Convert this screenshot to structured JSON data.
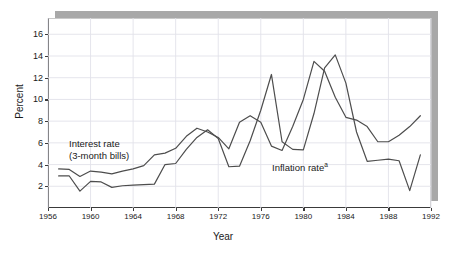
{
  "chart_data": {
    "type": "line",
    "title": "",
    "xlabel": "Year",
    "ylabel": "Percent",
    "xlim": [
      1956,
      1992
    ],
    "ylim": [
      0,
      17.5
    ],
    "grid": true,
    "legend_position": "inline-annotations",
    "xticks": [
      1956,
      1960,
      1964,
      1968,
      1972,
      1976,
      1980,
      1984,
      1988,
      1992
    ],
    "yticks": [
      2,
      4,
      6,
      8,
      10,
      12,
      14,
      16
    ],
    "x": [
      1957,
      1958,
      1959,
      1960,
      1961,
      1962,
      1963,
      1964,
      1965,
      1966,
      1967,
      1968,
      1969,
      1970,
      1971,
      1972,
      1973,
      1974,
      1975,
      1976,
      1977,
      1978,
      1979,
      1980,
      1981,
      1982,
      1983,
      1984,
      1985,
      1986,
      1987,
      1988,
      1989,
      1990,
      1991
    ],
    "series": [
      {
        "name": "Interest rate (3-month bills)",
        "values": [
          3.6,
          3.55,
          2.9,
          3.4,
          3.3,
          3.15,
          3.4,
          3.6,
          3.9,
          4.9,
          5.05,
          5.5,
          6.6,
          7.35,
          7.0,
          6.5,
          5.45,
          7.9,
          8.5,
          7.9,
          5.7,
          5.3,
          7.5,
          10.0,
          13.5,
          12.6,
          10.2,
          8.35,
          8.1,
          7.5,
          6.1,
          6.1,
          6.7,
          7.5,
          8.5
        ]
      },
      {
        "name": "Inflation rate",
        "values": [
          2.95,
          2.95,
          1.55,
          2.45,
          2.4,
          1.9,
          2.05,
          2.1,
          2.15,
          2.2,
          4.0,
          4.1,
          5.4,
          6.5,
          7.2,
          6.4,
          3.8,
          3.85,
          6.2,
          9.0,
          12.3,
          6.1,
          5.4,
          5.35,
          8.7,
          12.9,
          14.1,
          11.5,
          7.0,
          4.3,
          4.4,
          4.5,
          4.35,
          1.6,
          4.9
        ]
      }
    ],
    "annotations": [
      {
        "id": "interest",
        "line1": "Interest rate",
        "line2": "(3-month bills)"
      },
      {
        "id": "inflation",
        "text": "Inflation rate",
        "footnote_marker": "a"
      }
    ],
    "colors": {
      "line": "#4d4d4d",
      "axis": "#3a3a3a",
      "grid": "#e2e2ea",
      "shadow": "#a8a8a8",
      "background": "#ffffff",
      "text": "#1a1a1a"
    }
  }
}
